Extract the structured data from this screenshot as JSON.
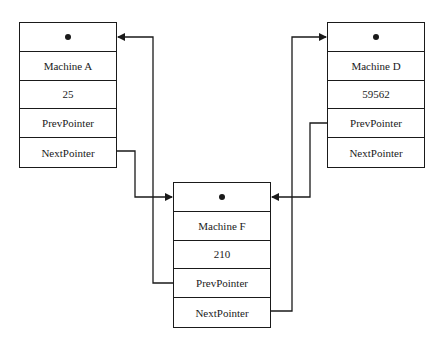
{
  "diagram": {
    "type": "doubly-linked-list",
    "nodes": [
      {
        "id": "A",
        "head": "•",
        "name": "Machine A",
        "value": "25",
        "prev": "PrevPointer",
        "next": "NextPointer"
      },
      {
        "id": "F",
        "head": "•",
        "name": "Machine F",
        "value": "210",
        "prev": "PrevPointer",
        "next": "NextPointer"
      },
      {
        "id": "D",
        "head": "•",
        "name": "Machine D",
        "value": "59562",
        "prev": "PrevPointer",
        "next": "NextPointer"
      }
    ],
    "edges": [
      {
        "from": "A.NextPointer",
        "to": "F.head"
      },
      {
        "from": "F.PrevPointer",
        "to": "A.head"
      },
      {
        "from": "F.NextPointer",
        "to": "D.head"
      },
      {
        "from": "D.PrevPointer",
        "to": "F.head"
      }
    ],
    "colors": {
      "line": "#1a1a1a",
      "background": "#ffffff"
    }
  }
}
